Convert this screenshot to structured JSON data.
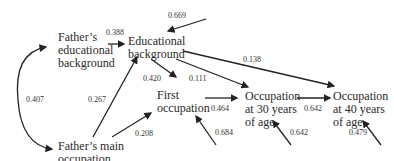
{
  "diagram": {
    "type": "path-analysis",
    "nodes": {
      "father_edu": [
        "Father’s",
        "educational",
        "background"
      ],
      "father_occ": [
        "Father’s main",
        "occupation"
      ],
      "edu_bg": [
        "Educational",
        "background"
      ],
      "first_occ": [
        "First",
        "occupation"
      ],
      "occ_30": [
        "Occupation",
        "at 30 years",
        "of age"
      ],
      "occ_40": [
        "Occupation",
        "at 40 years",
        "of age"
      ]
    },
    "edges": [
      {
        "from": "father_edu",
        "to": "edu_bg",
        "coef": "0.388"
      },
      {
        "from": "father_occ",
        "to": "edu_bg",
        "coef": "0.267"
      },
      {
        "from": "father_occ",
        "to": "first_occ",
        "coef": "0.208"
      },
      {
        "from": "edu_bg",
        "to": "first_occ",
        "coef": "0.420"
      },
      {
        "from": "edu_bg",
        "to": "occ_30",
        "coef": "0.111"
      },
      {
        "from": "edu_bg",
        "to": "occ_40",
        "coef": "0.138"
      },
      {
        "from": "first_occ",
        "to": "occ_30",
        "coef": "0.464"
      },
      {
        "from": "occ_30",
        "to": "occ_40",
        "coef": "0.642"
      },
      {
        "from": "father_edu",
        "to": "father_occ",
        "coef": "0.407",
        "kind": "correlation"
      }
    ],
    "residuals": [
      {
        "to": "edu_bg",
        "coef": "0.669"
      },
      {
        "to": "first_occ",
        "coef": "0.684"
      },
      {
        "to": "occ_30",
        "coef": "0.642"
      },
      {
        "to": "occ_40",
        "coef": "0.479"
      }
    ]
  }
}
